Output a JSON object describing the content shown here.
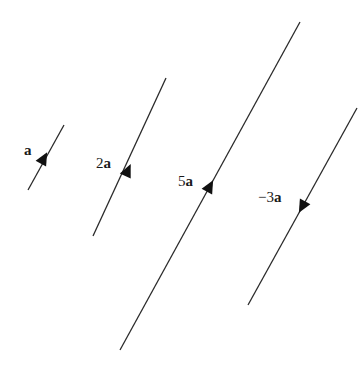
{
  "diagram": {
    "line_color": "#2a2a2a",
    "vectors": [
      {
        "id": "a",
        "coef": "",
        "sym": "a",
        "x1": 28,
        "y1": 190,
        "x2": 64,
        "y2": 125,
        "ax": 44,
        "ay": 158,
        "dir": "up",
        "lx": 24,
        "ly": 155
      },
      {
        "id": "2a",
        "coef": "2",
        "sym": "a",
        "x1": 93,
        "y1": 236,
        "x2": 166,
        "y2": 78,
        "ax": 128,
        "ay": 170,
        "dir": "up",
        "lx": 96,
        "ly": 168
      },
      {
        "id": "5a",
        "coef": "5",
        "sym": "a",
        "x1": 120,
        "y1": 350,
        "x2": 300,
        "y2": 22,
        "ax": 210,
        "ay": 186,
        "dir": "up",
        "lx": 178,
        "ly": 186
      },
      {
        "id": "-3a",
        "coef": "−3",
        "sym": "a",
        "x1": 248,
        "y1": 305,
        "x2": 357,
        "y2": 108,
        "ax": 302,
        "ay": 207,
        "dir": "down",
        "lx": 258,
        "ly": 202
      }
    ]
  }
}
